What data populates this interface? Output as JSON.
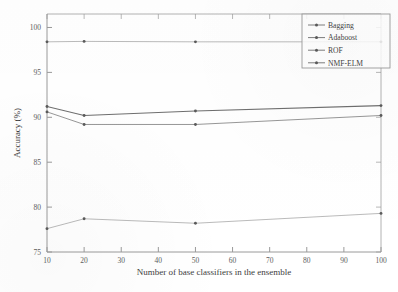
{
  "chart_data": {
    "type": "line",
    "title": "",
    "subtitle": "",
    "xlabel": "Number of base classifiers in the ensemble",
    "ylabel": "Accuracy (%)",
    "x": [
      10,
      20,
      30,
      40,
      50,
      60,
      70,
      80,
      90,
      100
    ],
    "xtick_labels": [
      "10",
      "20",
      "30",
      "40",
      "50",
      "60",
      "70",
      "80",
      "90",
      "100"
    ],
    "ytick_labels": [
      "75",
      "80",
      "85",
      "90",
      "95",
      "100"
    ],
    "yticks": [
      75,
      80,
      85,
      90,
      95,
      100
    ],
    "xlim": [
      10,
      100
    ],
    "ylim": [
      75,
      101.5
    ],
    "grid": false,
    "legend_position": "upper-right-inside",
    "series": [
      {
        "name": "Bagging",
        "marker": "dot",
        "x": [
          10,
          20,
          50,
          100
        ],
        "values": [
          77.6,
          78.7,
          78.2,
          79.3
        ]
      },
      {
        "name": "Adaboost",
        "marker": "dot",
        "x": [
          10,
          20,
          50,
          100
        ],
        "values": [
          90.6,
          89.2,
          89.2,
          90.2
        ]
      },
      {
        "name": "ROF",
        "marker": "dot",
        "x": [
          10,
          20,
          50,
          100
        ],
        "values": [
          91.2,
          90.2,
          90.7,
          91.3
        ]
      },
      {
        "name": "NMF-ELM",
        "marker": "dot",
        "x": [
          10,
          20,
          50,
          100
        ],
        "values": [
          98.4,
          98.45,
          98.4,
          98.4
        ]
      }
    ],
    "colors": {
      "axis": "#9a9a9a",
      "bagging": "#a8a8a8",
      "adaboost": "#8b8b8b",
      "rof": "#6f6f6f",
      "nmf_elm": "#a0a0a0",
      "background": "#ffffff"
    }
  },
  "legend": {
    "items": [
      {
        "label": "Bagging"
      },
      {
        "label": "Adaboost"
      },
      {
        "label": "ROF"
      },
      {
        "label": "NMF-ELM"
      }
    ]
  }
}
